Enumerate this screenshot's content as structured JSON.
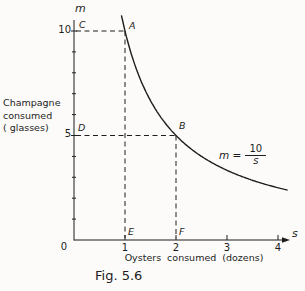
{
  "figure": {
    "caption": "Fig. 5.6",
    "origin_label": "0",
    "y_axis_symbol": "m",
    "x_axis_symbol": "s",
    "y_axis_title_lines": [
      "Champagne",
      "consumed",
      "( glasses)"
    ],
    "x_axis_title": "Oysters consumed (dozens)",
    "equation": {
      "lhs": "m =",
      "numerator": "10",
      "denominator": "s"
    }
  },
  "chart_data": {
    "type": "line",
    "title": "Fig. 5.6",
    "xlabel": "Oysters consumed (dozens)",
    "ylabel": "Champagne consumed (glasses)",
    "x_var": "s",
    "y_var": "m",
    "equation": "m = 10/s",
    "curve": {
      "k": 10,
      "s_range": [
        0.93,
        4.2
      ]
    },
    "xlim": [
      0,
      4.35
    ],
    "ylim": [
      0,
      10.9
    ],
    "x_ticks": [
      1,
      2,
      3,
      4
    ],
    "y_major_ticks": [
      5,
      10
    ],
    "y_minor_ticks": [
      1,
      2,
      3,
      4,
      6,
      7,
      8,
      9
    ],
    "grid": false,
    "key_points": [
      {
        "label": "A",
        "s": 1,
        "m": 10,
        "guides": true
      },
      {
        "label": "B",
        "s": 2,
        "m": 5,
        "guides": true
      },
      {
        "label": "C",
        "s": 0,
        "m": 10,
        "guides": false
      },
      {
        "label": "D",
        "s": 0,
        "m": 5,
        "guides": false
      },
      {
        "label": "E",
        "s": 1,
        "m": 0,
        "guides": false
      },
      {
        "label": "F",
        "s": 2,
        "m": 0,
        "guides": false
      }
    ],
    "line_color": "#1d1d1d"
  }
}
